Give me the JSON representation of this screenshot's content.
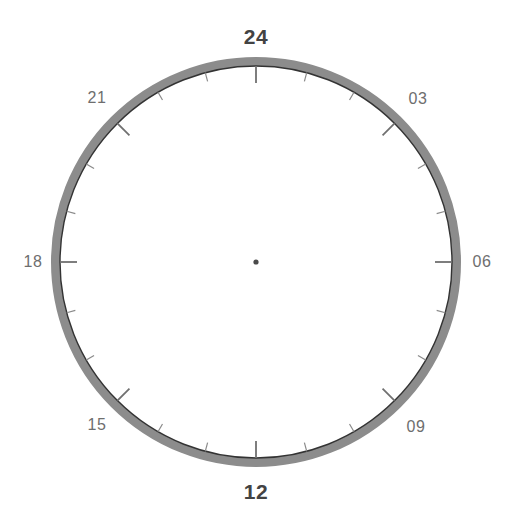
{
  "figure": {
    "background_color": "#ffffff",
    "width": 511,
    "height": 524
  },
  "dial": {
    "center_x": 256,
    "center_y": 262,
    "outer_radius": 205,
    "band_width": 9,
    "band_color": "#8c8c8c",
    "inner_circle_color": "#333333",
    "inner_circle_width": 1.4,
    "center_dot_color": "#4a4a4a",
    "center_dot_radius": 2.6,
    "tick_color": "#8a8a8a",
    "major_tick_color": "#707070",
    "minor_tick_length": 9,
    "major_tick_length": 17,
    "hours_total": 24,
    "degrees_per_hour": 15
  },
  "labels": [
    {
      "text": "24",
      "hour": 24,
      "angle_deg": 0,
      "style": "major",
      "x": 256,
      "y": 36,
      "major_tick": true
    },
    {
      "text": "03",
      "hour": 3,
      "angle_deg": 45,
      "style": "minor",
      "x": 418,
      "y": 99,
      "major_tick": true
    },
    {
      "text": "06",
      "hour": 6,
      "angle_deg": 90,
      "style": "minor",
      "x": 482,
      "y": 262,
      "major_tick": true
    },
    {
      "text": "09",
      "hour": 9,
      "angle_deg": 135,
      "style": "minor",
      "x": 416,
      "y": 427,
      "major_tick": true
    },
    {
      "text": "12",
      "hour": 12,
      "angle_deg": 180,
      "style": "major",
      "x": 256,
      "y": 491,
      "major_tick": true
    },
    {
      "text": "15",
      "hour": 15,
      "angle_deg": 225,
      "style": "minor",
      "x": 97,
      "y": 425,
      "major_tick": true
    },
    {
      "text": "18",
      "hour": 18,
      "angle_deg": 270,
      "style": "minor",
      "x": 33,
      "y": 262,
      "major_tick": true
    },
    {
      "text": "21",
      "hour": 21,
      "angle_deg": 315,
      "style": "minor",
      "x": 97,
      "y": 98,
      "major_tick": true
    }
  ],
  "ticks": {
    "minor_hours": [
      1,
      2,
      4,
      5,
      7,
      8,
      10,
      11,
      13,
      14,
      16,
      17,
      19,
      20,
      22,
      23
    ],
    "major_hours": [
      24,
      3,
      6,
      9,
      12,
      15,
      18,
      21
    ]
  },
  "chart_data": {
    "type": "polar-axis",
    "angular_unit": "hour",
    "angular_range": [
      0,
      24
    ],
    "tick_labels": [
      "24",
      "03",
      "06",
      "09",
      "12",
      "15",
      "18",
      "21"
    ],
    "tick_label_hours": [
      24,
      3,
      6,
      9,
      12,
      15,
      18,
      21
    ],
    "tick_label_angles_deg": [
      0,
      45,
      90,
      135,
      180,
      225,
      270,
      315
    ],
    "minor_tick_interval_hours": 1,
    "major_tick_interval_hours": 3,
    "grid": false,
    "legend": null,
    "series": [],
    "values": [],
    "xlabel": "",
    "ylabel": ""
  }
}
